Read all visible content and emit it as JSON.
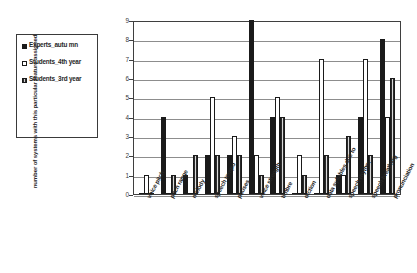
{
  "chart_data": {
    "type": "bar",
    "title": "",
    "xlabel": "",
    "ylabel": "number of systems with this particular feature assigned",
    "ylim": [
      0,
      9
    ],
    "ytick_labels": [
      "9",
      "8",
      "7",
      "6",
      "5",
      "4",
      "3",
      "2",
      "1",
      "0"
    ],
    "grid": true,
    "legend_position": "left-outside",
    "categories": [
      "voice pitch",
      "pitch range",
      "melody",
      "speech tempo",
      "pauses",
      "voice strength",
      "timbre",
      "diction",
      "data syllables due to",
      "speech rhythm",
      "speech breathing",
      "pronunciation"
    ],
    "series": [
      {
        "name": "Experts_autumn",
        "color": "#1a1a1a",
        "values": [
          0,
          4,
          1,
          2,
          2,
          9,
          4,
          0,
          0,
          1,
          4,
          8
        ]
      },
      {
        "name": "Students_4th year",
        "color": "#ffffff",
        "values": [
          1,
          0,
          0,
          5,
          3,
          2,
          5,
          2,
          7,
          1,
          7,
          4
        ]
      },
      {
        "name": "Students_3rd year",
        "color": "#8a8a8a",
        "values": [
          0,
          1,
          2,
          2,
          2,
          1,
          4,
          1,
          2,
          3,
          2,
          6
        ]
      }
    ]
  },
  "legend": {
    "items": [
      {
        "label": "Experts_autu mn",
        "key": "black-square-key"
      },
      {
        "label": "Students_4th year",
        "key": "white-square-key"
      },
      {
        "label": "Students_3rd year",
        "key": "hatched-square-key"
      }
    ]
  }
}
